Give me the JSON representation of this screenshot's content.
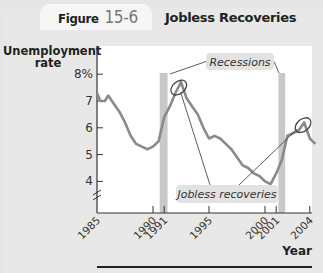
{
  "figure": {
    "label": "Figure",
    "number": "15-6",
    "title": "Jobless Recoveries"
  },
  "chart_data": {
    "type": "line",
    "title": "Jobless Recoveries",
    "xlabel": "Year",
    "ylabel": "Unemployment rate",
    "ylim": [
      3.3,
      8.5
    ],
    "xlim": [
      1985,
      2004.7
    ],
    "y_ticks": [
      {
        "value": 8,
        "label": "8%"
      },
      {
        "value": 7,
        "label": "7"
      },
      {
        "value": 6,
        "label": "6"
      },
      {
        "value": 5,
        "label": "5"
      },
      {
        "value": 4,
        "label": "4"
      }
    ],
    "x_ticks": [
      {
        "value": 1985,
        "label": "1985"
      },
      {
        "value": 1990,
        "label": "1990"
      },
      {
        "value": 1991,
        "label": "1991"
      },
      {
        "value": 1995,
        "label": "1995"
      },
      {
        "value": 2000,
        "label": "2000"
      },
      {
        "value": 2001,
        "label": "2001"
      },
      {
        "value": 2004,
        "label": "2004"
      }
    ],
    "axis_break": true,
    "grid": false,
    "series": [
      {
        "name": "Unemployment rate",
        "color": "#8a8a8a",
        "x": [
          1985.0,
          1985.3,
          1985.7,
          1986.0,
          1986.5,
          1987.0,
          1987.5,
          1988.0,
          1988.5,
          1989.0,
          1989.5,
          1990.0,
          1990.5,
          1991.0,
          1991.5,
          1992.0,
          1992.5,
          1993.0,
          1993.5,
          1994.0,
          1994.5,
          1995.0,
          1995.5,
          1996.0,
          1996.5,
          1997.0,
          1997.5,
          1998.0,
          1998.5,
          1999.0,
          1999.5,
          2000.0,
          2000.5,
          2001.0,
          2001.5,
          2002.0,
          2002.5,
          2003.0,
          2003.5,
          2004.0,
          2004.5
        ],
        "values": [
          7.3,
          7.0,
          7.0,
          7.2,
          6.9,
          6.6,
          6.2,
          5.7,
          5.4,
          5.3,
          5.2,
          5.3,
          5.5,
          6.4,
          6.8,
          7.3,
          7.7,
          7.1,
          6.8,
          6.5,
          6.0,
          5.6,
          5.7,
          5.6,
          5.4,
          5.2,
          4.9,
          4.6,
          4.5,
          4.3,
          4.2,
          4.0,
          3.9,
          4.3,
          4.8,
          5.7,
          5.8,
          5.9,
          6.2,
          5.6,
          5.4
        ]
      }
    ],
    "shaded_regions": [
      {
        "name": "Recession",
        "x_start": 1990.6,
        "x_end": 1991.3,
        "color": "#c8c8c8"
      },
      {
        "name": "Recession",
        "x_start": 2001.2,
        "x_end": 2001.8,
        "color": "#c8c8c8"
      }
    ],
    "annotations": [
      {
        "text": "Recessions",
        "type": "callout",
        "points_to": [
          "recession 1990-91",
          "recession 2001"
        ]
      },
      {
        "text": "Jobless recoveries",
        "type": "callout",
        "points_to": [
          "1992 peak",
          "2003 peak"
        ]
      }
    ],
    "highlight_ellipses": [
      {
        "x": 1992.3,
        "y": 7.5
      },
      {
        "x": 2003.4,
        "y": 6.1
      }
    ]
  }
}
